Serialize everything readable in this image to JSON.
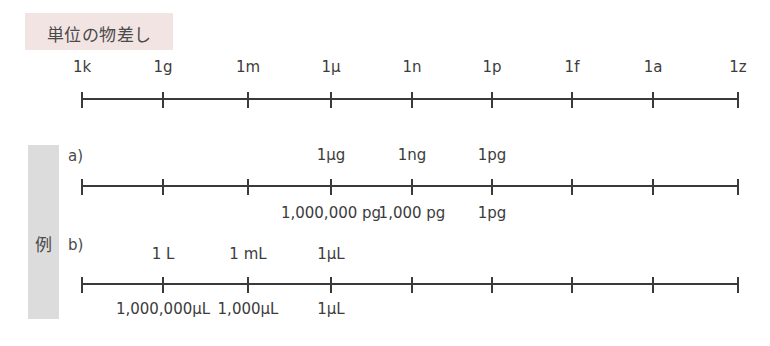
{
  "title": "単位の物差し",
  "example_label": "例",
  "tick_x": [
    82,
    163,
    248,
    331,
    412,
    492,
    572,
    653,
    738
  ],
  "scale": {
    "labels": [
      "1k",
      "1g",
      "1m",
      "1μ",
      "1n",
      "1p",
      "1f",
      "1a",
      "1z"
    ]
  },
  "example_a": {
    "label": "a)",
    "top_labels": [
      {
        "tick": 3,
        "text": "1μg"
      },
      {
        "tick": 4,
        "text": "1ng"
      },
      {
        "tick": 5,
        "text": "1pg"
      }
    ],
    "bottom_labels": [
      {
        "tick": 3,
        "text": "1,000,000 pg"
      },
      {
        "tick": 4,
        "text": "1,000 pg"
      },
      {
        "tick": 5,
        "text": "1pg"
      }
    ]
  },
  "example_b": {
    "label": "b)",
    "top_labels": [
      {
        "tick": 1,
        "text": "1 L"
      },
      {
        "tick": 2,
        "text": "1 mL"
      },
      {
        "tick": 3,
        "text": "1μL"
      }
    ],
    "bottom_labels": [
      {
        "tick": 1,
        "text": "1,000,000μL"
      },
      {
        "tick": 2,
        "text": "1,000μL"
      },
      {
        "tick": 3,
        "text": "1μL"
      }
    ]
  },
  "colors": {
    "title_bg": "#f3e4e4",
    "example_bg": "#dcdcdc",
    "line": "#3a3a3a"
  }
}
